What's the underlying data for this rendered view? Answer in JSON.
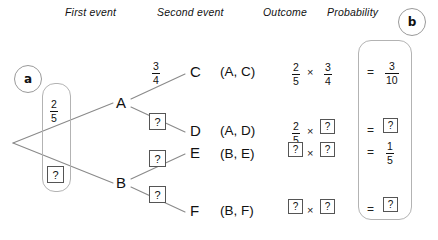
{
  "headers": [
    {
      "label": "First event"
    },
    {
      "label": "Second event"
    },
    {
      "label": "Outcome"
    },
    {
      "label": "Probability"
    }
  ],
  "part_labels": {
    "a": "a",
    "b": "b"
  },
  "tree": {
    "root_branches": [
      {
        "node": "A",
        "probability": {
          "kind": "fraction",
          "num": "2",
          "den": "5"
        }
      },
      {
        "node": "B",
        "probability": {
          "kind": "unknown",
          "text": "?"
        }
      }
    ],
    "second_branches": [
      {
        "node": "C",
        "parent": "A",
        "probability": {
          "kind": "fraction",
          "num": "3",
          "den": "4"
        }
      },
      {
        "node": "D",
        "parent": "A",
        "probability": {
          "kind": "unknown",
          "text": "?"
        }
      },
      {
        "node": "E",
        "parent": "B",
        "probability": {
          "kind": "unknown",
          "text": "?"
        }
      },
      {
        "node": "F",
        "parent": "B",
        "probability": {
          "kind": "unknown",
          "text": "?"
        }
      }
    ]
  },
  "rows": [
    {
      "outcome": "(A, C)",
      "factor1": {
        "kind": "fraction",
        "num": "2",
        "den": "5"
      },
      "operator": "×",
      "factor2": {
        "kind": "fraction",
        "num": "3",
        "den": "4"
      },
      "equals": "=",
      "result": {
        "kind": "fraction",
        "num": "3",
        "den": "10"
      }
    },
    {
      "outcome": "(A, D)",
      "factor1": {
        "kind": "fraction",
        "num": "2",
        "den": "5"
      },
      "operator": "×",
      "factor2": {
        "kind": "unknown",
        "text": "?"
      },
      "equals": "=",
      "result": {
        "kind": "unknown",
        "text": "?"
      }
    },
    {
      "outcome": "(B, E)",
      "factor1": {
        "kind": "unknown",
        "text": "?"
      },
      "operator": "×",
      "factor2": {
        "kind": "unknown",
        "text": "?"
      },
      "equals": "=",
      "result": {
        "kind": "fraction",
        "num": "1",
        "den": "5"
      }
    },
    {
      "outcome": "(B, F)",
      "factor1": {
        "kind": "unknown",
        "text": "?"
      },
      "operator": "×",
      "factor2": {
        "kind": "unknown",
        "text": "?"
      },
      "equals": "=",
      "result": {
        "kind": "unknown",
        "text": "?"
      }
    }
  ],
  "colors": {
    "ink": "#111111",
    "line": "#888888",
    "panel_border": "#b3b3b3",
    "box_border": "#555555",
    "background": "#ffffff"
  }
}
